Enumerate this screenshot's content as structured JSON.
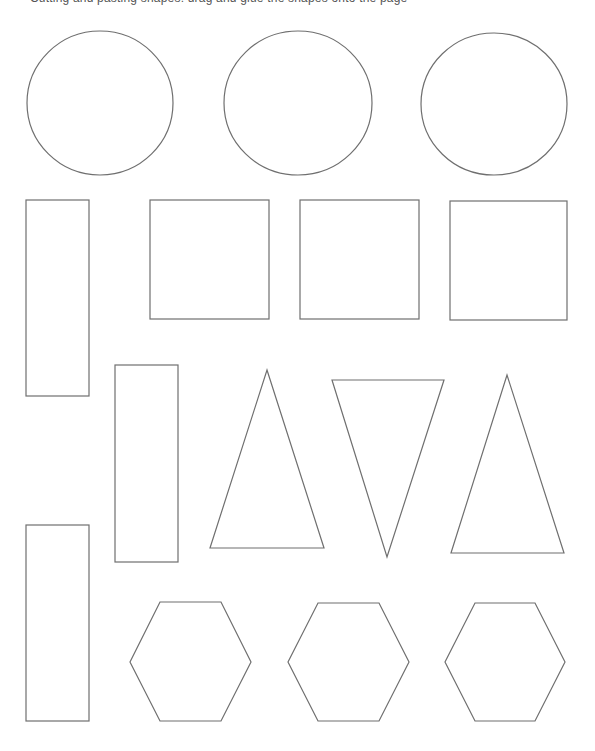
{
  "page": {
    "caption": "Cutting and pasting shapes: drag and glue the shapes onto the page"
  },
  "style": {
    "stroke_color": "#6f6f6f",
    "background": "#ffffff"
  },
  "shapes": {
    "circles": [
      {
        "name": "circle-1",
        "cx": 100,
        "cy": 103,
        "rx": 73,
        "ry": 72
      },
      {
        "name": "circle-2",
        "cx": 298,
        "cy": 103,
        "rx": 74,
        "ry": 72
      },
      {
        "name": "circle-3",
        "cx": 494,
        "cy": 104,
        "rx": 73,
        "ry": 71
      }
    ],
    "squares": [
      {
        "name": "square-1",
        "x": 150,
        "y": 200,
        "w": 119,
        "h": 119
      },
      {
        "name": "square-2",
        "x": 300,
        "y": 200,
        "w": 119,
        "h": 119
      },
      {
        "name": "square-3",
        "x": 450,
        "y": 201,
        "w": 117,
        "h": 119
      }
    ],
    "rectangles": [
      {
        "name": "rectangle-1",
        "x": 26,
        "y": 200,
        "w": 63,
        "h": 196
      },
      {
        "name": "rectangle-2",
        "x": 115,
        "y": 365,
        "w": 63,
        "h": 197
      },
      {
        "name": "rectangle-3",
        "x": 26,
        "y": 525,
        "w": 63,
        "h": 196
      }
    ],
    "triangles": [
      {
        "name": "triangle-1",
        "points": "267,370 324,548 210,548"
      },
      {
        "name": "triangle-inverted",
        "points": "332,380 444,380 387,557"
      },
      {
        "name": "triangle-3",
        "points": "507,375 564,553 451,553"
      }
    ],
    "hexagons": [
      {
        "name": "hexagon-1",
        "points": "160,602 221,602 251,662 221,721 160,721 130,662"
      },
      {
        "name": "hexagon-2",
        "points": "318,603 379,603 409,662 379,721 318,721 288,662"
      },
      {
        "name": "hexagon-3",
        "points": "475,603 535,603 565,662 535,721 475,721 445,662"
      }
    ]
  }
}
